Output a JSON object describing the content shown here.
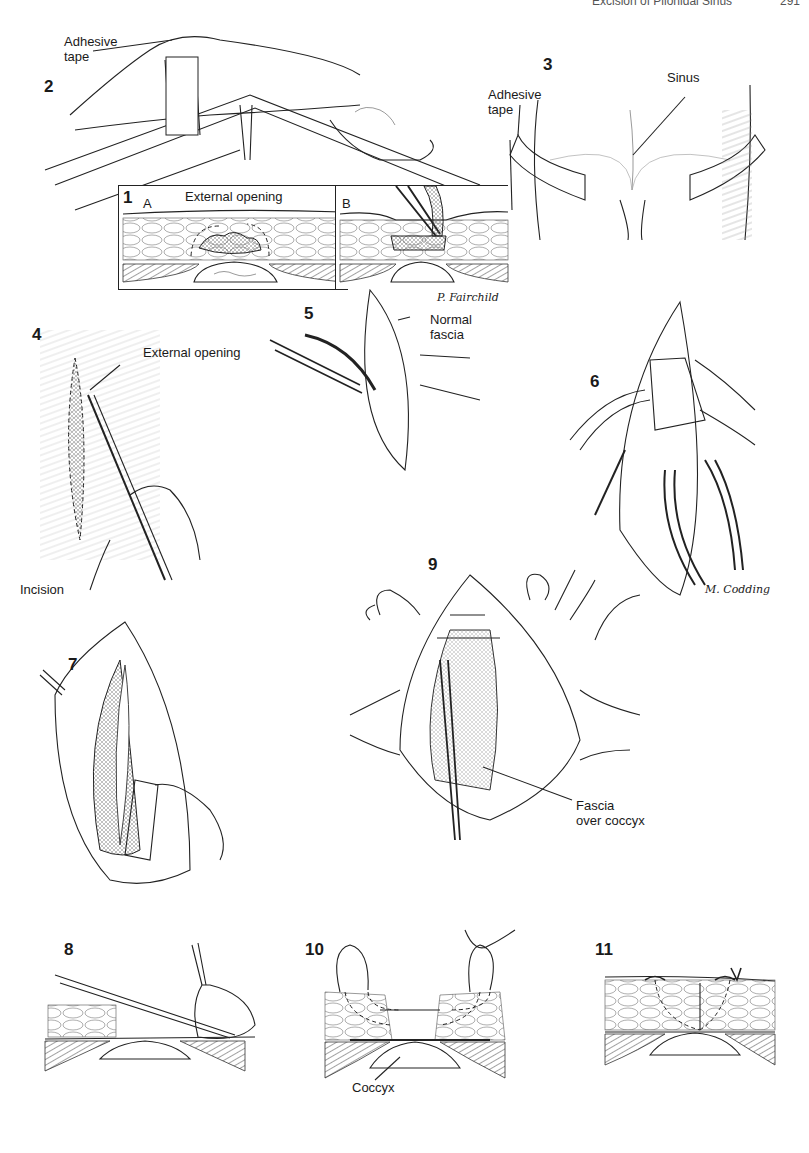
{
  "page_header": {
    "running_title": "Excision of Pilonidal Sinus",
    "page_number": "291"
  },
  "figures": [
    {
      "number": "1",
      "panels": [
        {
          "letter": "A"
        },
        {
          "letter": "B"
        }
      ],
      "labels": [
        "External opening"
      ],
      "signature": "P. Fairchild"
    },
    {
      "number": "2",
      "labels": [
        "Adhesive tape"
      ]
    },
    {
      "number": "3",
      "labels": [
        "Adhesive tape",
        "Sinus"
      ]
    },
    {
      "number": "4",
      "labels": [
        "External opening",
        "Incision"
      ]
    },
    {
      "number": "5",
      "labels": [
        "Normal fascia"
      ]
    },
    {
      "number": "6",
      "labels": [],
      "signature": "M. Codding"
    },
    {
      "number": "7",
      "labels": []
    },
    {
      "number": "8",
      "labels": []
    },
    {
      "number": "9",
      "labels": [
        "Fascia over coccyx"
      ]
    },
    {
      "number": "10",
      "labels": [
        "Coccyx"
      ]
    },
    {
      "number": "11",
      "labels": []
    }
  ],
  "text": {
    "f2_tape_l1": "Adhesive",
    "f2_tape_l2": "tape",
    "f1_ext": "External opening",
    "f3_tape_l1": "Adhesive",
    "f3_tape_l2": "tape",
    "f3_sinus": "Sinus",
    "f4_ext": "External opening",
    "f4_incision": "Incision",
    "f5_l1": "Normal",
    "f5_l2": "fascia",
    "f9_l1": "Fascia",
    "f9_l2": "over coccyx",
    "f10_coccyx": "Coccyx",
    "sig1": "P. Fairchild",
    "sig2": "M. Codding"
  }
}
